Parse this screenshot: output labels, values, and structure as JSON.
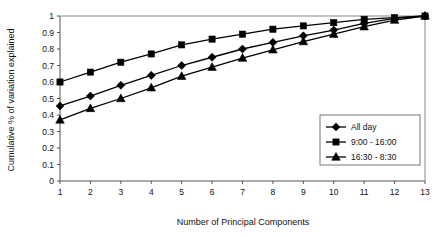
{
  "chart_data": {
    "type": "line",
    "title": "",
    "xlabel": "Number of Principal Components",
    "ylabel": "Cumulative % of variation explained",
    "x": [
      1,
      2,
      3,
      4,
      5,
      6,
      7,
      8,
      9,
      10,
      11,
      12,
      13
    ],
    "xtick_labels": [
      "1",
      "2",
      "3",
      "4",
      "5",
      "6",
      "7",
      "8",
      "9",
      "10",
      "11",
      "12",
      "13"
    ],
    "ytick_labels": [
      "0",
      "0.1",
      "0.2",
      "0.3",
      "0.4",
      "0.5",
      "0.6",
      "0.7",
      "0.8",
      "0.9",
      "1"
    ],
    "ytick_values": [
      0,
      0.1,
      0.2,
      0.3,
      0.4,
      0.5,
      0.6,
      0.7,
      0.8,
      0.9,
      1
    ],
    "xlim": [
      1,
      13
    ],
    "ylim": [
      0,
      1
    ],
    "grid": false,
    "legend_position": "center-right",
    "series": [
      {
        "name": "All day",
        "marker": "diamond",
        "color": "#000000",
        "values": [
          0.455,
          0.515,
          0.58,
          0.64,
          0.7,
          0.75,
          0.8,
          0.84,
          0.88,
          0.915,
          0.955,
          0.985,
          1.0
        ]
      },
      {
        "name": "9:00 - 16:00",
        "marker": "square",
        "color": "#000000",
        "values": [
          0.6,
          0.66,
          0.72,
          0.77,
          0.825,
          0.86,
          0.89,
          0.92,
          0.94,
          0.96,
          0.98,
          0.99,
          1.0
        ]
      },
      {
        "name": "16:30 - 8:30",
        "marker": "triangle",
        "color": "#000000",
        "values": [
          0.37,
          0.44,
          0.5,
          0.565,
          0.635,
          0.69,
          0.745,
          0.795,
          0.845,
          0.89,
          0.935,
          0.975,
          1.0
        ]
      }
    ]
  },
  "legend": {
    "entries": [
      {
        "label": "All day",
        "marker": "diamond"
      },
      {
        "label": "9:00 - 16:00",
        "marker": "square"
      },
      {
        "label": "16:30 - 8:30",
        "marker": "triangle"
      }
    ]
  }
}
